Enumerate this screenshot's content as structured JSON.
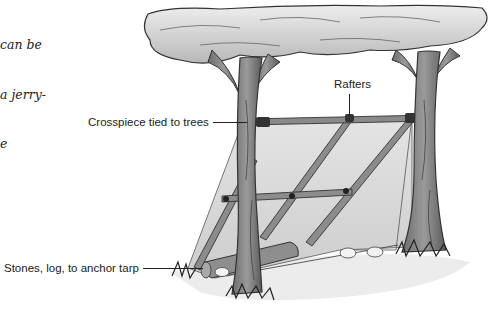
{
  "caption": {
    "lines": [
      "can be",
      "a jerry-",
      "e"
    ]
  },
  "labels": {
    "rafters": "Rafters",
    "crosspiece": "Crosspiece tied to trees",
    "anchor": "Stones, log, to anchor tarp"
  },
  "colors": {
    "background": "#ffffff",
    "tarp": "#dcdcdc",
    "tarp_shadow": "#c4c4c4",
    "wood": "#8a8a8a",
    "wood_dark": "#4a4a4a",
    "canopy": "#d8d8d8",
    "ground_shadow": "#e6e6e6",
    "text": "#222222"
  }
}
